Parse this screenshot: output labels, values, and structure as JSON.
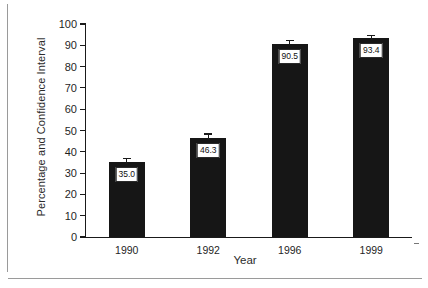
{
  "chart_data": {
    "type": "bar",
    "title": "",
    "subtitle": "",
    "xlabel": "Year",
    "ylabel": "Percentage and Confidence Interval",
    "categories": [
      "1990",
      "1992",
      "1996",
      "1999"
    ],
    "values": [
      35.0,
      46.3,
      90.5,
      93.4
    ],
    "value_labels": [
      "35.0",
      "46.3",
      "90.5",
      "93.4"
    ],
    "errors": [
      2.0,
      2.3,
      1.9,
      1.6
    ],
    "ylim": [
      0,
      100
    ],
    "yticks": [
      0,
      10,
      20,
      30,
      40,
      50,
      60,
      70,
      80,
      90,
      100
    ],
    "ytick_labels": [
      "0",
      "10",
      "20",
      "30",
      "40",
      "50",
      "60",
      "70",
      "80",
      "90",
      "100"
    ],
    "grid": false,
    "legend": false,
    "legend_position": "none",
    "bar_color": "#161616",
    "axis_color": "#1a1a1a",
    "series": [
      {
        "name": "Percentage",
        "values": [
          35.0,
          46.3,
          90.5,
          93.4
        ]
      }
    ]
  },
  "axes": {
    "y_axis_title": "Percentage and Confidence Interval",
    "x_axis_title": "Year"
  }
}
